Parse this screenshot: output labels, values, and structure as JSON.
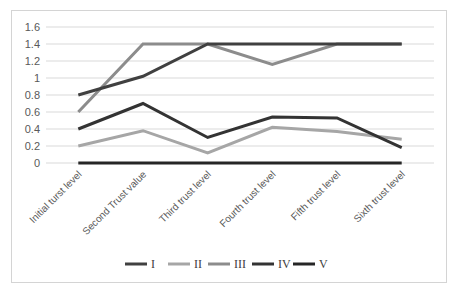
{
  "chart_data": {
    "type": "line",
    "title": "",
    "xlabel": "",
    "ylabel": "",
    "categories": [
      "Initial turst level",
      "Second Trust value",
      "Third trust level",
      "Fourth trust level",
      "Fifth trust level",
      "Sixth trust level"
    ],
    "series": [
      {
        "name": "I",
        "color": "#404040",
        "values": [
          0.8,
          1.02,
          1.4,
          1.4,
          1.4,
          1.4
        ]
      },
      {
        "name": "II",
        "color": "#a6a6a6",
        "values": [
          0.2,
          0.38,
          0.12,
          0.42,
          0.37,
          0.28
        ]
      },
      {
        "name": "III",
        "color": "#8c8c8c",
        "values": [
          0.6,
          1.4,
          1.4,
          1.16,
          1.4,
          1.4
        ]
      },
      {
        "name": "IV",
        "color": "#333333",
        "values": [
          0.4,
          0.7,
          0.3,
          0.54,
          0.53,
          0.18
        ]
      },
      {
        "name": "V",
        "color": "#262626",
        "values": [
          0,
          0,
          0,
          0,
          0,
          0
        ]
      }
    ],
    "yticks": [
      "0",
      "0.2",
      "0.4",
      "0.6",
      "0.8",
      "1",
      "1.2",
      "1.4",
      "1.6"
    ],
    "ylim": [
      0,
      1.6
    ],
    "grid": true,
    "legend_position": "bottom"
  }
}
